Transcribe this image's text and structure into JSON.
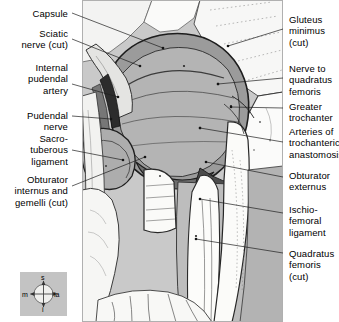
{
  "figure": {
    "background_color": "#ffffff",
    "panel_color": "#c9c9c9"
  },
  "labels_left": [
    {
      "id": "capsule",
      "text": "Capsule",
      "x": 2,
      "y": 8,
      "width": 66
    },
    {
      "id": "sciatic-nerve",
      "text": "Sciatic\nnerve (cut)",
      "x": 2,
      "y": 28,
      "width": 66
    },
    {
      "id": "internal-pudendal",
      "text": "Internal\npudendal\nartery",
      "x": 2,
      "y": 62,
      "width": 66
    },
    {
      "id": "pudendal-nerve",
      "text": "Pudendal\nnerve",
      "x": 2,
      "y": 110,
      "width": 66
    },
    {
      "id": "sacrotuberous",
      "text": "Sacro-\ntuberous\nligament",
      "x": 2,
      "y": 133,
      "width": 66
    },
    {
      "id": "obturator-internus",
      "text": "Obturator\ninternus and\ngemelli (cut)",
      "x": 0,
      "y": 174,
      "width": 68
    }
  ],
  "labels_right": [
    {
      "id": "gluteus-minimus",
      "text": "Gluteus\nminimus\n(cut)",
      "x": 289,
      "y": 14,
      "width": 50
    },
    {
      "id": "nerve-to-quadratus",
      "text": "Nerve to\nquadratus\nfemoris",
      "x": 289,
      "y": 63,
      "width": 50
    },
    {
      "id": "greater-trochanter",
      "text": "Greater\ntrochanter",
      "x": 289,
      "y": 101,
      "width": 50
    },
    {
      "id": "arteries-trochanteric",
      "text": "Arteries of\ntrochanteric\nanastomosis",
      "x": 289,
      "y": 126,
      "width": 50
    },
    {
      "id": "obturator-externus",
      "text": "Obturator\nexternus",
      "x": 289,
      "y": 170,
      "width": 50
    },
    {
      "id": "ischiofemoral",
      "text": "Ischio-\nfemoral\nligament",
      "x": 289,
      "y": 204,
      "width": 50
    },
    {
      "id": "quadratus-femoris",
      "text": "Quadratus\nfemoris (cut)",
      "x": 289,
      "y": 248,
      "width": 50
    }
  ],
  "leaders": [
    {
      "id": "leader-capsule",
      "x1": 72,
      "y1": 13,
      "x2": 163,
      "y2": 48
    },
    {
      "id": "leader-sciatic-nerve",
      "x1": 72,
      "y1": 39,
      "x2": 140,
      "y2": 66
    },
    {
      "id": "leader-internal-pudendal",
      "x1": 72,
      "y1": 84,
      "x2": 118,
      "y2": 97
    },
    {
      "id": "leader-pudendal-nerve",
      "x1": 72,
      "y1": 116,
      "x2": 111,
      "y2": 119
    },
    {
      "id": "leader-sacrotuberous",
      "x1": 72,
      "y1": 150,
      "x2": 123,
      "y2": 160
    },
    {
      "id": "leader-obturator-internus",
      "x1": 72,
      "y1": 186,
      "x2": 145,
      "y2": 157
    },
    {
      "id": "leader-gluteus-minimus",
      "x1": 283,
      "y1": 29,
      "x2": 228,
      "y2": 46
    },
    {
      "id": "leader-nerve-to-quadratus",
      "x1": 283,
      "y1": 78,
      "x2": 218,
      "y2": 84
    },
    {
      "id": "leader-greater-trochanter",
      "x1": 283,
      "y1": 108,
      "x2": 231,
      "y2": 107
    },
    {
      "id": "leader-arteries-trochanteric",
      "x1": 283,
      "y1": 142,
      "x2": 200,
      "y2": 128
    },
    {
      "id": "leader-obturator-externus",
      "x1": 283,
      "y1": 177,
      "x2": 206,
      "y2": 162
    },
    {
      "id": "leader-ischiofemoral",
      "x1": 283,
      "y1": 213,
      "x2": 200,
      "y2": 199
    },
    {
      "id": "leader-quadratus-femoris",
      "x1": 283,
      "y1": 253,
      "x2": 196,
      "y2": 239
    }
  ],
  "compass": {
    "superior": "s",
    "inferior": "i",
    "medial": "m",
    "lateral": "la",
    "background_color": "#c3c3c3"
  }
}
